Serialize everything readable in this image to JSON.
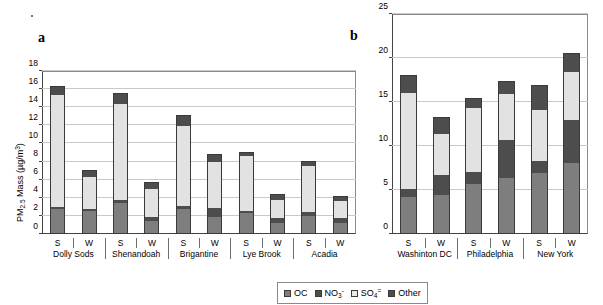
{
  "figure": {
    "panel_a_letter": "a",
    "panel_b_letter": "b"
  },
  "legend": {
    "position": "bottom-center",
    "items": [
      {
        "key": "OC",
        "label": "OC",
        "color": "#7e7e7e"
      },
      {
        "key": "NO3",
        "label": "NO",
        "sub": "3",
        "sup": "-",
        "color": "#4d4d4d"
      },
      {
        "key": "SO4",
        "label": "SO",
        "sub": "4",
        "sup": "=",
        "color": "#e9e9e9"
      },
      {
        "key": "Other",
        "label": "Other",
        "color": "#4d4d4d"
      }
    ]
  },
  "chart_data": [
    {
      "id": "panel-a",
      "type": "bar",
      "stacked": true,
      "title": "a",
      "xlabel": "",
      "ylabel": "PM2.5 Mass (ug/m3)",
      "ylabel_parts": {
        "prefix": "PM",
        "sub": "2.5",
        "mid": " Mass (µg/m",
        "sup": "3",
        "suffix": ")"
      },
      "ylim": [
        0,
        18
      ],
      "yticks": [
        0,
        2,
        4,
        6,
        8,
        10,
        12,
        14,
        16,
        18
      ],
      "grid": true,
      "categories": [
        "S",
        "W",
        "S",
        "W",
        "S",
        "W",
        "S",
        "W",
        "S",
        "W"
      ],
      "groups": [
        "Dolly Sods",
        "Shenandoah",
        "Brigantine",
        "Lye Brook",
        "Acadia"
      ],
      "series": [
        {
          "name": "OC",
          "color": "#7e7e7e",
          "values": [
            2.6,
            2.4,
            3.3,
            1.3,
            2.6,
            1.8,
            2.2,
            1.1,
            1.9,
            1.1
          ]
        },
        {
          "name": "NO3",
          "color": "#4d4d4d",
          "values": [
            0.3,
            0.3,
            0.3,
            0.5,
            0.4,
            1.0,
            0.2,
            0.6,
            0.4,
            0.6
          ]
        },
        {
          "name": "SO4",
          "color": "#e2e2e2",
          "values": [
            12.3,
            3.5,
            10.7,
            3.1,
            8.8,
            5.0,
            6.1,
            1.9,
            5.1,
            1.8
          ]
        },
        {
          "name": "Other",
          "color": "#4d4d4d",
          "values": [
            0.9,
            0.6,
            1.0,
            0.6,
            1.1,
            0.8,
            0.3,
            0.6,
            0.4,
            0.5
          ]
        }
      ],
      "totals": [
        16.1,
        6.8,
        15.3,
        5.5,
        12.9,
        8.6,
        8.8,
        4.2,
        7.8,
        4.0
      ]
    },
    {
      "id": "panel-b",
      "type": "bar",
      "stacked": true,
      "title": "b",
      "xlabel": "",
      "ylabel": "",
      "ylim": [
        0,
        25
      ],
      "yticks": [
        0,
        5,
        10,
        15,
        20,
        25
      ],
      "grid": true,
      "categories": [
        "S",
        "W",
        "S",
        "W",
        "S",
        "W"
      ],
      "groups": [
        "Washinton DC",
        "Philadelphia",
        "New York"
      ],
      "series": [
        {
          "name": "OC",
          "color": "#7e7e7e",
          "values": [
            4.1,
            4.3,
            5.6,
            6.2,
            6.8,
            8.0
          ]
        },
        {
          "name": "NO3",
          "color": "#4d4d4d",
          "values": [
            0.9,
            2.3,
            1.3,
            4.4,
            1.4,
            4.8
          ]
        },
        {
          "name": "SO4",
          "color": "#e2e2e2",
          "values": [
            10.9,
            4.7,
            7.3,
            5.2,
            5.8,
            5.5
          ]
        },
        {
          "name": "Other",
          "color": "#4d4d4d",
          "values": [
            1.9,
            1.8,
            1.0,
            1.4,
            2.7,
            2.1
          ]
        }
      ],
      "totals": [
        17.8,
        13.1,
        15.2,
        17.2,
        16.7,
        20.4
      ]
    }
  ]
}
